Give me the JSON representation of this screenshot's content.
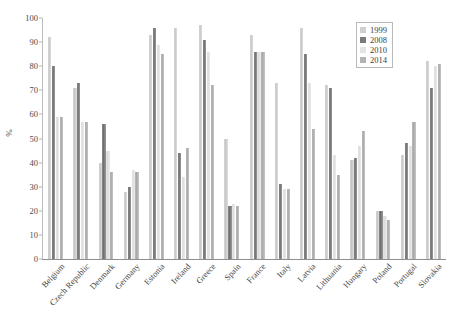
{
  "chart_data": {
    "type": "bar",
    "title": "",
    "subtitle": "",
    "xlabel": "",
    "ylabel": "%",
    "ylim": [
      0,
      100
    ],
    "ytick_step": 10,
    "yticks": [
      100,
      90,
      80,
      70,
      60,
      50,
      40,
      30,
      20,
      10,
      0
    ],
    "grid": false,
    "legend_position": "top-right",
    "categories": [
      "Belgium",
      "Czech Republic",
      "Denmark",
      "Germany",
      "Estonia",
      "Ireland",
      "Greece",
      "Spain",
      "France",
      "Italy",
      "Latvia",
      "Lithuania",
      "Hungary",
      "Poland",
      "Portugal",
      "Slovakia"
    ],
    "series": [
      {
        "name": "1999",
        "color": "#d0d0d0",
        "values": [
          92,
          71,
          40,
          28,
          93,
          96,
          97,
          50,
          93,
          73,
          96,
          72,
          41,
          20,
          43,
          82
        ]
      },
      {
        "name": "2008",
        "color": "#7b7b7b",
        "values": [
          80,
          73,
          56,
          30,
          96,
          44,
          91,
          22,
          86,
          31,
          85,
          71,
          42,
          20,
          48,
          71
        ]
      },
      {
        "name": "2010",
        "color": "#e4e4e4",
        "values": [
          59,
          57,
          45,
          37,
          89,
          34,
          86,
          23,
          86,
          29,
          73,
          43,
          47,
          18,
          47,
          80
        ]
      },
      {
        "name": "2014",
        "color": "#b3b3b3",
        "values": [
          59,
          57,
          36,
          36,
          85,
          46,
          72,
          22,
          86,
          29,
          54,
          35,
          53,
          16,
          57,
          81
        ]
      }
    ]
  },
  "legend": {
    "entries": [
      {
        "label": "1999"
      },
      {
        "label": "2008"
      },
      {
        "label": "2010"
      },
      {
        "label": "2014"
      }
    ]
  }
}
